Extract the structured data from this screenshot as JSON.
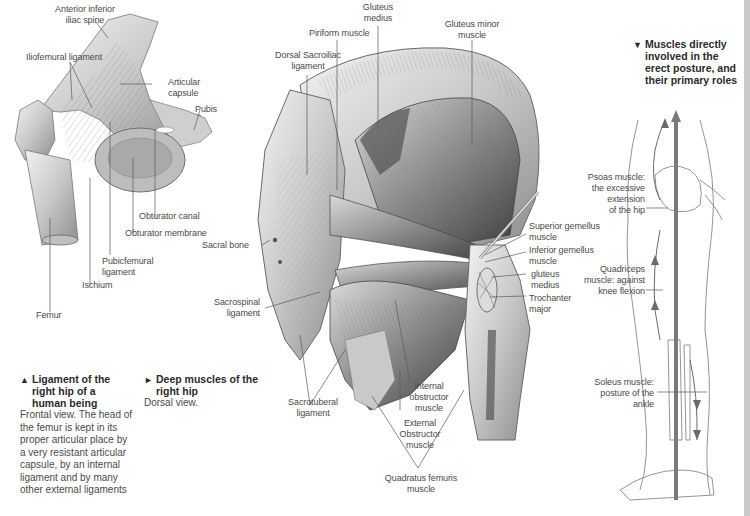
{
  "figure_hip_ligaments": {
    "labels": {
      "anterior_inferior_iliac_spine": "Anterior inferior\niliac spine",
      "iliofemoral_ligament": "Iliofemural ligament",
      "articular_capsule": "Articular\ncapsule",
      "pubis": "Pubis",
      "obturator_canal": "Obturator canal",
      "obturator_membrane": "Obturator membrane",
      "pubicfemoral_ligament": "Pubicfemural\nligament",
      "ischium": "Ischium",
      "femur": "Femur"
    },
    "caption": {
      "marker": "▲",
      "title": "Ligament of the\nright hip of a\nhuman being",
      "body": "Frontal view. The head of\nthe femur is kept in its\nproper articular place by\na very resistant articular\ncapsule, by an internal\nligament and by many\nother external ligaments"
    }
  },
  "figure_deep_muscles": {
    "labels": {
      "gluteus_medius_top": "Gluteus\nmedius",
      "gluteus_minor_muscle": "Gluteus minor\nmuscle",
      "piriform_muscle": "Piriform muscle",
      "dorsal_sacroiliac_ligament": "Dorsal Sacroiliac\nligament",
      "sacral_bone": "Sacral bone",
      "sacrospinal_ligament": "Sacrospinal\nligament",
      "sacrotuberal_ligament": "Sacrotuberal\nligament",
      "superior_gemellus_muscle": "Superior gemellus\nmuscle",
      "inferior_gemellus_muscle": "Inferior gemellus\nmuscle",
      "gluteus_medius_side": "gluteus\nmedius",
      "trochanter_major": "Trochanter\nmajor",
      "internal_obstructor_muscle": "Internal\nobstructor\nmuscle",
      "external_obstructor_muscle": "External\nObstructor\nmuscle",
      "quadratus_femuris_muscle": "Quadratus femuris\nmuscle"
    },
    "caption": {
      "marker": "►",
      "title": "Deep muscles of the\nright hip",
      "body": "Dorsal view."
    }
  },
  "figure_erect_posture": {
    "caption": {
      "marker": "▼",
      "title": "Muscles directly\ninvolved in the\nerect posture, and\ntheir primary roles"
    },
    "labels": {
      "psoas_muscle": "Psoas muscle:\nthe excessive\nextension\nof the hip",
      "quadriceps_muscle": "Quadriceps\nmuscle: against\nknee flexion",
      "soleus_muscle": "Soleus muscle:\nposture of the\nankle"
    }
  },
  "colors": {
    "label_text": "#4a4a4a",
    "caption_title": "#2a2a2a",
    "leader_line": "#5a5a5a",
    "axis_line": "#7a7a7a",
    "edge_bar": "#c9c9c9"
  }
}
